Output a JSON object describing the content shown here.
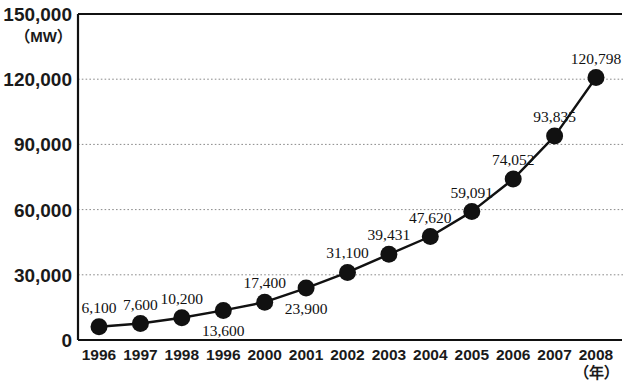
{
  "chart_data": {
    "type": "line",
    "title": "",
    "subtitle": "",
    "xlabel": "（年）",
    "ylabel": "（MW）",
    "y_unit": "（MW）",
    "x_unit": "（年）",
    "grid": true,
    "legend": "none",
    "ylim": [
      0,
      150000
    ],
    "yticks": [
      "0",
      "30,000",
      "60,000",
      "90,000",
      "120,000",
      "150,000"
    ],
    "ytick_values": [
      0,
      30000,
      60000,
      90000,
      120000,
      150000
    ],
    "gridline_values": [
      30000,
      60000,
      90000,
      120000
    ],
    "categories": [
      "1996",
      "1997",
      "1998",
      "1996",
      "2000",
      "2001",
      "2002",
      "2003",
      "2004",
      "2005",
      "2006",
      "2007",
      "2008"
    ],
    "values": [
      6100,
      7600,
      10200,
      13600,
      17400,
      23900,
      31100,
      39431,
      47620,
      59091,
      74052,
      93835,
      120798
    ],
    "point_labels": [
      "6,100",
      "7,600",
      "10,200",
      "13,600",
      "17,400",
      "23,900",
      "31,100",
      "39,431",
      "47,620",
      "59,091",
      "74,052",
      "93,835",
      "120,798"
    ],
    "point_label_positions": [
      "above",
      "above",
      "above",
      "below",
      "above",
      "below",
      "above",
      "above",
      "above",
      "above",
      "above",
      "above",
      "above"
    ],
    "series": [
      {
        "name": "",
        "marker": "filled-circle",
        "color": "#111111",
        "values": [
          6100,
          7600,
          10200,
          13600,
          17400,
          23900,
          31100,
          39431,
          47620,
          59091,
          74052,
          93835,
          120798
        ]
      }
    ]
  },
  "colors": {
    "line": "#111111",
    "marker": "#111111",
    "axis": "#111111",
    "grid": "#8a8a8a",
    "background": "#ffffff"
  }
}
